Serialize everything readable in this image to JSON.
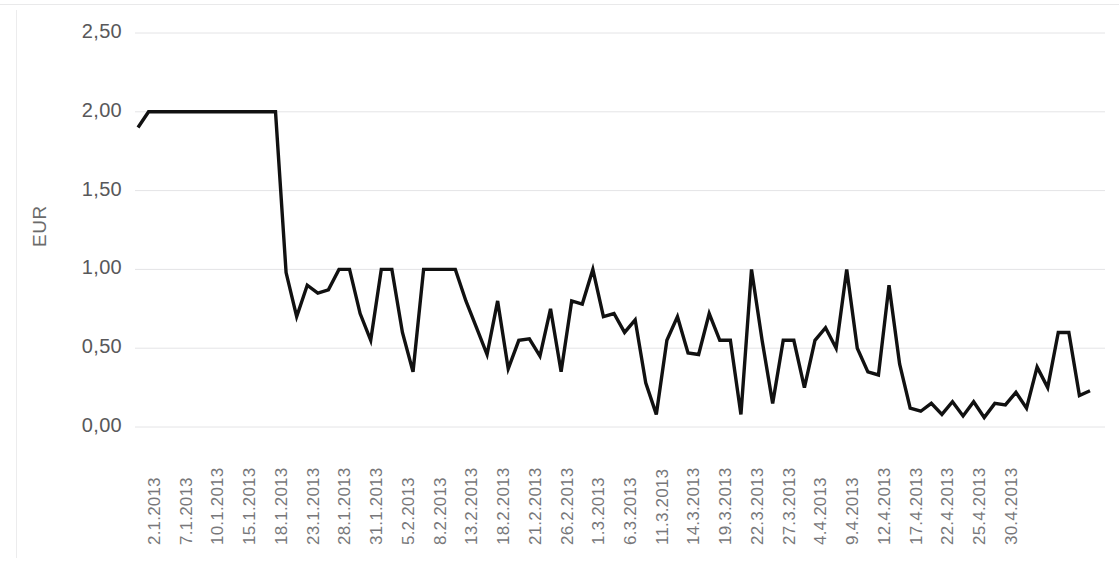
{
  "chart_data": {
    "type": "line",
    "title": "",
    "subtitle": "",
    "xlabel": "",
    "ylabel": "EUR",
    "ylim": [
      0,
      2.5
    ],
    "yticks": [
      0,
      0.5,
      1.0,
      1.5,
      2.0,
      2.5
    ],
    "ytick_labels": [
      "0,00",
      "0,50",
      "1,00",
      "1,50",
      "2,00",
      "2,50"
    ],
    "grid": true,
    "grid_axis": "y",
    "legend": false,
    "legend_position": "none",
    "line_color": "#111111",
    "line_width": 3.4,
    "background_color": "#ffffff",
    "decimal_separator": ",",
    "xtick_labels": [
      "2.1.2013",
      "7.1.2013",
      "10.1.2013",
      "15.1.2013",
      "18.1.2013",
      "23.1.2013",
      "28.1.2013",
      "31.1.2013",
      "5.2.2013",
      "8.2.2013",
      "13.2.2013",
      "18.2.2013",
      "21.2.2013",
      "26.2.2013",
      "1.3.2013",
      "6.3.2013",
      "11.3.2013",
      "14.3.2013",
      "19.3.2013",
      "22.3.2013",
      "27.3.2013",
      "4.4.2013",
      "9.4.2013",
      "12.4.2013",
      "17.4.2013",
      "22.4.2013",
      "25.4.2013",
      "30.4.2013"
    ],
    "xtick_every_n_points": 3,
    "series": [
      {
        "name": "EUR",
        "values": [
          1.9,
          2.0,
          2.0,
          2.0,
          2.0,
          2.0,
          2.0,
          2.0,
          2.0,
          2.0,
          2.0,
          2.0,
          2.0,
          2.0,
          0.98,
          0.7,
          0.9,
          0.85,
          0.87,
          1.0,
          1.0,
          0.72,
          0.55,
          1.0,
          1.0,
          0.6,
          0.35,
          1.0,
          1.0,
          1.0,
          1.0,
          0.8,
          0.63,
          0.46,
          0.8,
          0.37,
          0.55,
          0.56,
          0.45,
          0.75,
          0.35,
          0.8,
          0.78,
          1.0,
          0.7,
          0.72,
          0.6,
          0.68,
          0.28,
          0.08,
          0.55,
          0.7,
          0.47,
          0.46,
          0.72,
          0.55,
          0.55,
          0.08,
          1.0,
          0.55,
          0.15,
          0.55,
          0.55,
          0.25,
          0.55,
          0.63,
          0.5,
          1.0,
          0.5,
          0.35,
          0.33,
          0.9,
          0.4,
          0.12,
          0.1,
          0.15,
          0.08,
          0.16,
          0.07,
          0.16,
          0.06,
          0.15,
          0.14,
          0.22,
          0.12,
          0.38,
          0.25,
          0.6,
          0.6,
          0.2,
          0.23
        ]
      }
    ]
  }
}
